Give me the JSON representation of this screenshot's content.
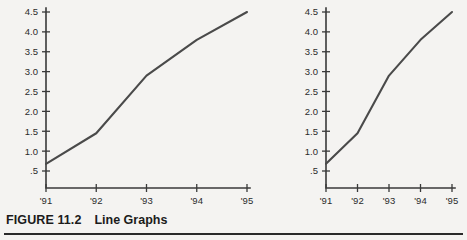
{
  "caption": {
    "label": "FIGURE 11.2",
    "title": "Line Graphs"
  },
  "charts": [
    {
      "name": "wide-line-graph",
      "aspect": "wide",
      "plot": {
        "left": 46,
        "right": 247,
        "top": 12,
        "bottom": 188
      }
    },
    {
      "name": "narrow-line-graph",
      "aspect": "narrow",
      "plot": {
        "left": 46,
        "right": 172,
        "top": 12,
        "bottom": 188
      }
    }
  ],
  "chart_data": [
    {
      "type": "line",
      "title": "",
      "xlabel": "",
      "ylabel": "",
      "categories": [
        "'91",
        "'92",
        "'93",
        "'94",
        "'95"
      ],
      "values": [
        0.68,
        1.45,
        2.9,
        3.8,
        4.5
      ],
      "series": [
        {
          "name": "series-1",
          "values": [
            0.68,
            1.45,
            2.9,
            3.8,
            4.5
          ]
        }
      ],
      "ytick_labels": [
        "4.5",
        "4.0",
        "3.5",
        "3.0",
        "2.5",
        "2.0",
        "1.5",
        "1.0",
        ".5"
      ],
      "ytick_values": [
        4.5,
        4.0,
        3.5,
        3.0,
        2.5,
        2.0,
        1.5,
        1.0,
        0.5
      ],
      "xtick_labels": [
        "'91",
        "'92",
        "'93",
        "'94",
        "'95"
      ],
      "ylim": [
        0.5,
        4.5
      ],
      "grid": false,
      "legend": false,
      "line_color": "#4a4a4a",
      "axis_color": "#3a3a3a"
    },
    {
      "type": "line",
      "title": "",
      "xlabel": "",
      "ylabel": "",
      "categories": [
        "'91",
        "'92",
        "'93",
        "'94",
        "'95"
      ],
      "values": [
        0.68,
        1.45,
        2.9,
        3.8,
        4.5
      ],
      "series": [
        {
          "name": "series-1",
          "values": [
            0.68,
            1.45,
            2.9,
            3.8,
            4.5
          ]
        }
      ],
      "ytick_labels": [
        "4.5",
        "4.0",
        "3.5",
        "3.0",
        "2.5",
        "2.0",
        "1.5",
        "1.0",
        ".5"
      ],
      "ytick_values": [
        4.5,
        4.0,
        3.5,
        3.0,
        2.5,
        2.0,
        1.5,
        1.0,
        0.5
      ],
      "xtick_labels": [
        "'91",
        "'92",
        "'93",
        "'94",
        "'95"
      ],
      "ylim": [
        0.5,
        4.5
      ],
      "grid": false,
      "legend": false,
      "line_color": "#4a4a4a",
      "axis_color": "#3a3a3a"
    }
  ]
}
